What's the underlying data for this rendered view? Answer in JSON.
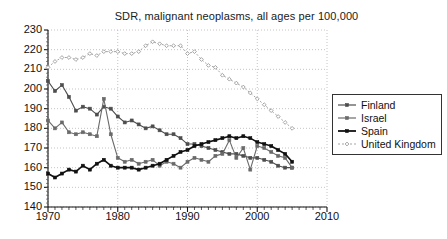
{
  "chart_data": {
    "type": "line",
    "title": "SDR, malignant neoplasms, all ages per 100,000",
    "xlabel": "",
    "ylabel": "",
    "xlim": [
      1970,
      2010
    ],
    "ylim": [
      140,
      230
    ],
    "xticks": [
      "1970",
      "1980",
      "1990",
      "2000",
      "2010"
    ],
    "yticks": [
      "140",
      "150",
      "160",
      "170",
      "180",
      "190",
      "200",
      "210",
      "220",
      "230"
    ],
    "grid": true,
    "legend_position": "right",
    "series": [
      {
        "name": "Finland",
        "color": "#4d4d4d",
        "marker": "square",
        "x": [
          1970,
          1971,
          1972,
          1973,
          1974,
          1975,
          1976,
          1977,
          1978,
          1979,
          1980,
          1981,
          1982,
          1983,
          1984,
          1985,
          1986,
          1987,
          1988,
          1989,
          1990,
          1991,
          1992,
          1993,
          1994,
          1995,
          1996,
          1997,
          1998,
          1999,
          2000,
          2001,
          2002,
          2003,
          2004,
          2005
        ],
        "values": [
          204,
          199,
          202,
          196,
          189,
          191,
          190,
          187,
          191,
          190,
          186,
          183,
          184,
          182,
          180,
          181,
          179,
          177,
          177,
          175,
          172,
          172,
          171,
          170,
          169,
          168,
          167,
          167,
          166,
          165,
          165,
          164,
          163,
          161,
          160,
          160
        ]
      },
      {
        "name": "Israel",
        "color": "#6a6a6a",
        "marker": "square",
        "x": [
          1970,
          1971,
          1972,
          1973,
          1974,
          1975,
          1976,
          1977,
          1978,
          1979,
          1980,
          1981,
          1982,
          1983,
          1984,
          1985,
          1986,
          1987,
          1988,
          1989,
          1990,
          1991,
          1992,
          1993,
          1994,
          1995,
          1996,
          1997,
          1998,
          1999,
          2000,
          2001,
          2002,
          2003,
          2004,
          2005
        ],
        "values": [
          184,
          180,
          183,
          178,
          177,
          178,
          177,
          176,
          195,
          177,
          165,
          163,
          164,
          162,
          163,
          164,
          161,
          163,
          162,
          160,
          163,
          165,
          164,
          163,
          166,
          167,
          174,
          165,
          170,
          159,
          171,
          170,
          168,
          166,
          165,
          160
        ]
      },
      {
        "name": "Spain",
        "color": "#111111",
        "marker": "square",
        "x": [
          1970,
          1971,
          1972,
          1973,
          1974,
          1975,
          1976,
          1977,
          1978,
          1979,
          1980,
          1981,
          1982,
          1983,
          1984,
          1985,
          1986,
          1987,
          1988,
          1989,
          1990,
          1991,
          1992,
          1993,
          1994,
          1995,
          1996,
          1997,
          1998,
          1999,
          2000,
          2001,
          2002,
          2003,
          2004,
          2005
        ],
        "values": [
          157,
          155,
          157,
          159,
          158,
          161,
          159,
          162,
          164,
          161,
          160,
          160,
          160,
          159,
          160,
          161,
          162,
          164,
          166,
          168,
          169,
          171,
          172,
          173,
          174,
          175,
          176,
          175,
          176,
          175,
          173,
          172,
          171,
          169,
          167,
          163
        ]
      },
      {
        "name": "United Kingdom",
        "color": "#9b9b9b",
        "marker": "diamond",
        "x": [
          1970,
          1971,
          1972,
          1973,
          1974,
          1975,
          1976,
          1977,
          1978,
          1979,
          1980,
          1981,
          1982,
          1983,
          1984,
          1985,
          1986,
          1987,
          1988,
          1989,
          1990,
          1991,
          1992,
          1993,
          1994,
          1995,
          1996,
          1997,
          1998,
          1999,
          2000,
          2001,
          2002,
          2003,
          2004,
          2005
        ],
        "values": [
          211,
          214,
          216,
          216,
          215,
          216,
          218,
          217,
          219,
          219,
          219,
          218,
          218,
          219,
          222,
          224,
          223,
          222,
          222,
          222,
          218,
          219,
          215,
          212,
          211,
          207,
          205,
          203,
          201,
          198,
          195,
          192,
          189,
          186,
          183,
          180
        ]
      }
    ]
  },
  "legend": {
    "items": [
      {
        "label": "Finland"
      },
      {
        "label": "Israel"
      },
      {
        "label": "Spain"
      },
      {
        "label": "United Kingdom"
      }
    ]
  }
}
